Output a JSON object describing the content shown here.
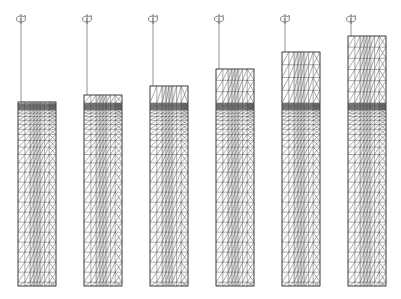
{
  "figure": {
    "width": 401,
    "height": 299,
    "line_color": "#555555",
    "dense_color": "#3a3a3a",
    "bottom_y": 286,
    "dense_band_y": 103,
    "spindle_top_y": 14,
    "columns": [
      {
        "x": 18,
        "w": 38,
        "top": 102
      },
      {
        "x": 84,
        "w": 38,
        "top": 95
      },
      {
        "x": 150,
        "w": 38,
        "top": 86
      },
      {
        "x": 216,
        "w": 38,
        "top": 69
      },
      {
        "x": 282,
        "w": 38,
        "top": 52
      },
      {
        "x": 348,
        "w": 38,
        "top": 36
      }
    ]
  },
  "icons": {
    "rotation": "rotation-arrow-icon"
  }
}
